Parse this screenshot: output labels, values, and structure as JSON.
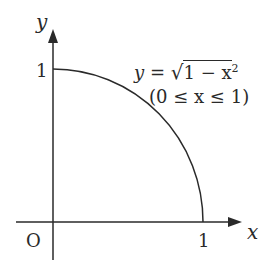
{
  "diagram": {
    "axes": {
      "x_label": "x",
      "y_label": "y",
      "origin_label": "O",
      "x_tick_label": "1",
      "y_tick_label": "1"
    },
    "curve": {
      "equation_lhs": "y =",
      "equation_rhs": "1 − x",
      "exponent": "2",
      "domain": "(0 ≤ x ≤ 1)"
    },
    "colors": {
      "line": "#2a2a2a",
      "background": "#ffffff"
    }
  }
}
